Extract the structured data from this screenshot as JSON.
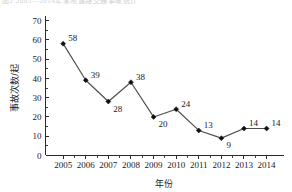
{
  "top_fragment": "图2 2005—2014年某地道路交通事故统计",
  "chart_data": {
    "type": "line",
    "title": "",
    "xlabel": "年份",
    "ylabel": "事故次数/起",
    "categories": [
      "2005",
      "2006",
      "2007",
      "2008",
      "2009",
      "2010",
      "2011",
      "2012",
      "2013",
      "2014"
    ],
    "values": [
      58,
      39,
      28,
      38,
      20,
      24,
      13,
      9,
      14,
      14
    ],
    "point_labels": [
      "58",
      "39",
      "28",
      "38",
      "20",
      "24",
      "13",
      "9",
      "14",
      "14"
    ],
    "label_positions": [
      "above-right",
      "above-right",
      "below-right",
      "above-right",
      "below-right",
      "above-right",
      "above-right",
      "below-right",
      "above-right",
      "above-right"
    ],
    "ylim": [
      0,
      70
    ],
    "yticks": [
      0,
      10,
      20,
      30,
      40,
      50,
      60,
      70
    ],
    "ytick_labels": [
      "0",
      "10",
      "20",
      "30",
      "40",
      "50",
      "60",
      "70"
    ],
    "y_minor_interval": 5,
    "grid": false,
    "legend": false,
    "marker": "diamond",
    "line_color": "#4d4d4d",
    "marker_color": "#111111",
    "axis_color": "#2b2b2b"
  }
}
